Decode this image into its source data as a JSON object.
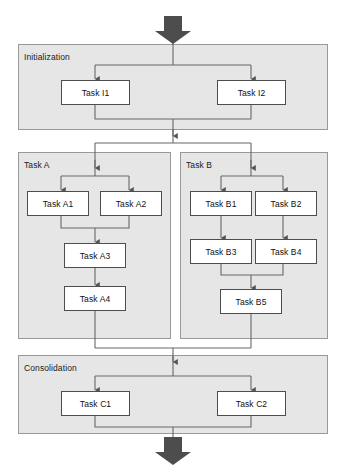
{
  "diagram": {
    "type": "flowchart",
    "title": "",
    "colors": {
      "page_background": "#ffffff",
      "group_fill": "#e6e6e6",
      "group_border": "#999999",
      "box_fill": "#ffffff",
      "box_border": "#4d4d4d",
      "connector": "#666666",
      "block_arrow": "#4d4d4d",
      "text": "#111111"
    },
    "entry_arrow": {
      "name": "entry-block-arrow",
      "direction": "down"
    },
    "exit_arrow": {
      "name": "exit-block-arrow",
      "direction": "down"
    },
    "groups": [
      {
        "id": "initialization",
        "label": "Initialization",
        "tasks": [
          {
            "id": "i1",
            "label": "Task I1"
          },
          {
            "id": "i2",
            "label": "Task I2"
          }
        ]
      },
      {
        "id": "task-a",
        "label": "Task A",
        "tasks": [
          {
            "id": "a1",
            "label": "Task A1"
          },
          {
            "id": "a2",
            "label": "Task A2"
          },
          {
            "id": "a3",
            "label": "Task A3"
          },
          {
            "id": "a4",
            "label": "Task A4"
          }
        ]
      },
      {
        "id": "task-b",
        "label": "Task B",
        "tasks": [
          {
            "id": "b1",
            "label": "Task B1"
          },
          {
            "id": "b2",
            "label": "Task B2"
          },
          {
            "id": "b3",
            "label": "Task B3"
          },
          {
            "id": "b4",
            "label": "Task B4"
          },
          {
            "id": "b5",
            "label": "Task B5"
          }
        ]
      },
      {
        "id": "consolidation",
        "label": "Consolidation",
        "tasks": [
          {
            "id": "c1",
            "label": "Task C1"
          },
          {
            "id": "c2",
            "label": "Task C2"
          }
        ]
      }
    ],
    "flow": [
      {
        "from": "entry",
        "to": "initialization"
      },
      {
        "from": "initialization",
        "to": "i1"
      },
      {
        "from": "initialization",
        "to": "i2"
      },
      {
        "from": "i1",
        "to": "initialization-join"
      },
      {
        "from": "i2",
        "to": "initialization-join"
      },
      {
        "from": "initialization-join",
        "to": "task-a"
      },
      {
        "from": "initialization-join",
        "to": "task-b"
      },
      {
        "from": "task-a",
        "to": "a1"
      },
      {
        "from": "task-a",
        "to": "a2"
      },
      {
        "from": "a1",
        "to": "a3"
      },
      {
        "from": "a2",
        "to": "a3"
      },
      {
        "from": "a3",
        "to": "a4"
      },
      {
        "from": "task-b",
        "to": "b1"
      },
      {
        "from": "task-b",
        "to": "b2"
      },
      {
        "from": "b1",
        "to": "b3"
      },
      {
        "from": "b2",
        "to": "b4"
      },
      {
        "from": "b3",
        "to": "b5"
      },
      {
        "from": "b4",
        "to": "b5"
      },
      {
        "from": "a4",
        "to": "consolidation"
      },
      {
        "from": "b5",
        "to": "consolidation"
      },
      {
        "from": "consolidation",
        "to": "c1"
      },
      {
        "from": "consolidation",
        "to": "c2"
      },
      {
        "from": "c1",
        "to": "exit"
      },
      {
        "from": "c2",
        "to": "exit"
      }
    ]
  }
}
